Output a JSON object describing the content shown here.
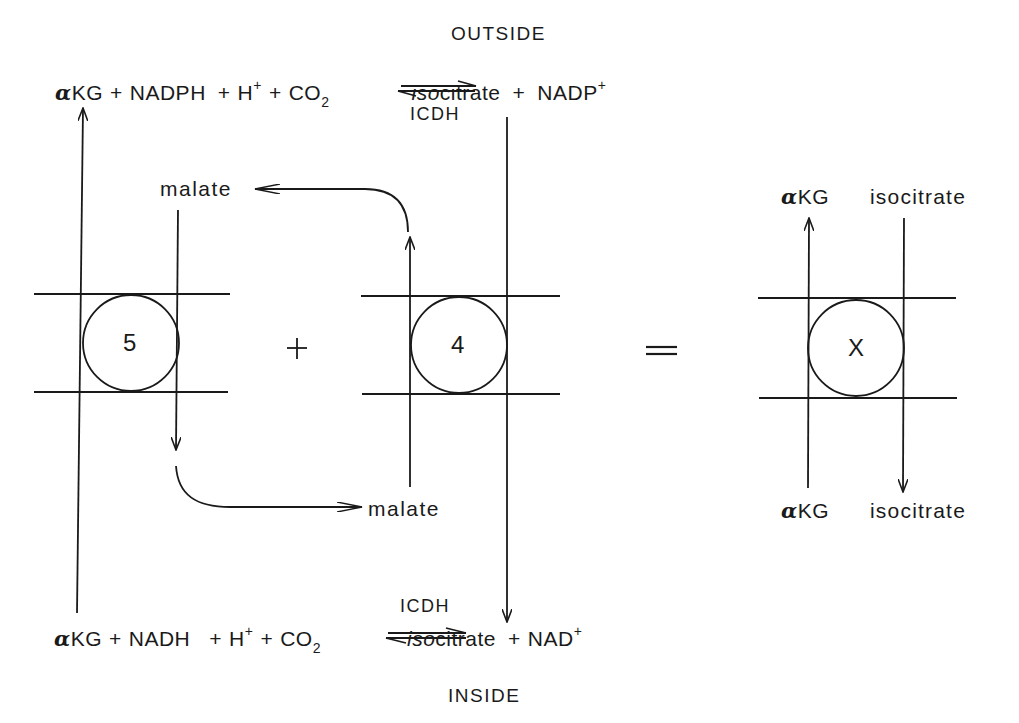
{
  "labels": {
    "outside": "OUTSIDE",
    "inside": "INSIDE"
  },
  "top_equation": {
    "alpha": "α",
    "akg": "KG",
    "plus1": "+",
    "nadph": "NADPH",
    "plus2": "+",
    "h": "H",
    "h_charge": "+",
    "plus3": "+",
    "co": "CO",
    "co_sub": "2",
    "iso": "iso",
    "citrate": "citrate",
    "plus4": "+",
    "nadp": "NADP",
    "nadp_charge": "+",
    "enzyme": "ICDH"
  },
  "bottom_equation": {
    "alpha": "α",
    "akg": "KG",
    "plus1": "+",
    "nadh": "NADH",
    "plus2": "+",
    "h": "H",
    "h_charge": "+",
    "plus3": "+",
    "co": "CO",
    "co_sub": "2",
    "iso": "iso",
    "citrate": "citrate",
    "plus4": "+",
    "nad": "NAD",
    "nad_charge": "+",
    "enzyme": "ICDH"
  },
  "transporters": [
    {
      "id": "5",
      "label": "5"
    },
    {
      "id": "4",
      "label": "4"
    },
    {
      "id": "X",
      "label": "X"
    }
  ],
  "operators": {
    "plus": "+",
    "equals": "="
  },
  "metabolites": {
    "malate_top": "malate",
    "malate_bottom": "malate"
  },
  "net_exchange": {
    "top_left_alpha": "α",
    "top_left": "KG",
    "top_right": "isocitrate",
    "bottom_left_alpha": "α",
    "bottom_left": "KG",
    "bottom_right": "isocitrate"
  },
  "colors": {
    "ink": "#1a1a1a",
    "background": "#ffffff"
  }
}
